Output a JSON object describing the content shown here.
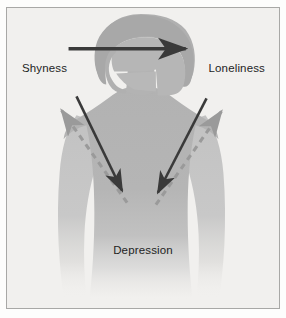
{
  "figure": {
    "title_labels": {
      "shyness": "Shyness",
      "loneliness": "Loneliness",
      "depression": "Depression"
    },
    "colors": {
      "background": "#f1f0ee",
      "border": "#a8a8a6",
      "silhouette_body": "#b4b4b4",
      "silhouette_light": "#c9c9c9",
      "silhouette_hair": "#a9a9a9",
      "solid_arrow": "#3a3a3a",
      "dashed_arrow": "#9a9a9a",
      "text": "#1e1e1e"
    },
    "arrows": [
      {
        "name": "shyness-to-loneliness",
        "style": "solid",
        "direction": "right",
        "from": "Shyness",
        "to": "Loneliness"
      },
      {
        "name": "shyness-to-depression",
        "style": "solid",
        "direction": "down-right",
        "from": "Shyness",
        "to": "Depression"
      },
      {
        "name": "loneliness-to-depression",
        "style": "solid",
        "direction": "down-left",
        "from": "Loneliness",
        "to": "Depression"
      },
      {
        "name": "depression-to-shyness",
        "style": "dashed",
        "direction": "up-left",
        "from": "Depression",
        "to": "Shyness"
      },
      {
        "name": "depression-to-loneliness",
        "style": "dashed",
        "direction": "up-right",
        "from": "Depression",
        "to": "Loneliness"
      }
    ],
    "silhouette": {
      "name": "female-figure-back-view",
      "description": "Gray silhouette of a person seen from behind with bob haircut"
    }
  }
}
